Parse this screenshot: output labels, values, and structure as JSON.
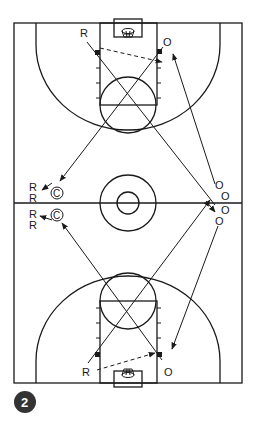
{
  "diagram": {
    "figure_number": "2",
    "colors": {
      "line": "#1a1a1a",
      "badge": "#333333",
      "badge_text": "#ffffff",
      "background": "#ffffff"
    },
    "labels": {
      "top_rebounder": "R",
      "top_outlet": "O",
      "bottom_rebounder": "R",
      "bottom_outlet": "O",
      "left_coach_top": "C",
      "left_coach_bottom": "C",
      "left_line_r1": "R",
      "left_line_r2": "R",
      "left_line_r3": "R",
      "left_line_r4": "R",
      "right_line_o1": "O",
      "right_line_o2": "O",
      "right_line_o3": "O",
      "right_line_o4": "O"
    }
  }
}
